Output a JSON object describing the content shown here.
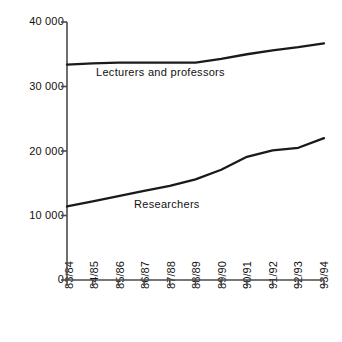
{
  "chart_data": {
    "type": "line",
    "title": "",
    "subtitle": "",
    "xlabel": "",
    "ylabel": "",
    "categories": [
      "83/84",
      "84/85",
      "85/86",
      "86/87",
      "87/88",
      "88/89",
      "89/90",
      "90/91",
      "91/92",
      "92/93",
      "93/94"
    ],
    "ylim": [
      0,
      40000
    ],
    "yticks": [
      0,
      10000,
      20000,
      30000,
      40000
    ],
    "ytick_labels": [
      "0",
      "10 000",
      "20 000",
      "30 000",
      "40 000"
    ],
    "grid": false,
    "legend_position": "inline-annotation",
    "series": [
      {
        "name": "Lecturers and professors",
        "values": [
          33400,
          33600,
          33700,
          33700,
          33700,
          33700,
          34300,
          35000,
          35600,
          36100,
          36700
        ],
        "color": "#1a1a1a"
      },
      {
        "name": "Researchers",
        "values": [
          11400,
          12200,
          13000,
          13800,
          14600,
          15600,
          17100,
          19100,
          20100,
          20500,
          22000
        ],
        "color": "#1a1a1a"
      }
    ],
    "annotations": [
      {
        "text": "Lecturers and professors",
        "x_px": 96,
        "y_px": 66
      },
      {
        "text": "Researchers",
        "x_px": 134,
        "y_px": 198
      }
    ]
  },
  "axes": {
    "axis_color": "#4a4a4a",
    "line_color": "#1a1a1a",
    "background": "#ffffff"
  }
}
